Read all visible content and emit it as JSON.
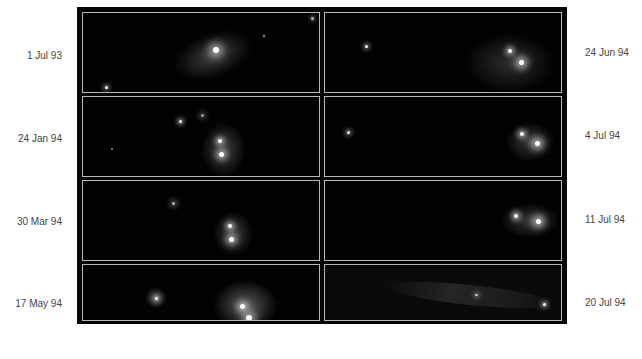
{
  "figure": {
    "panels": [
      {
        "date": "1 Jul 93",
        "column": "left",
        "row": 0
      },
      {
        "date": "24 Jan 94",
        "column": "left",
        "row": 1
      },
      {
        "date": "30 Mar 94",
        "column": "left",
        "row": 2
      },
      {
        "date": "17 May 94",
        "column": "left",
        "row": 3
      },
      {
        "date": "24 Jun 94",
        "column": "right",
        "row": 0
      },
      {
        "date": "4 Jul 94",
        "column": "right",
        "row": 1
      },
      {
        "date": "11 Jul 94",
        "column": "right",
        "row": 2
      },
      {
        "date": "20 Jul 94",
        "column": "right",
        "row": 3
      }
    ]
  },
  "colors": {
    "frame": "#050505",
    "panel_border": "#b8b8b8",
    "label": "#444444",
    "background": "#ffffff"
  }
}
